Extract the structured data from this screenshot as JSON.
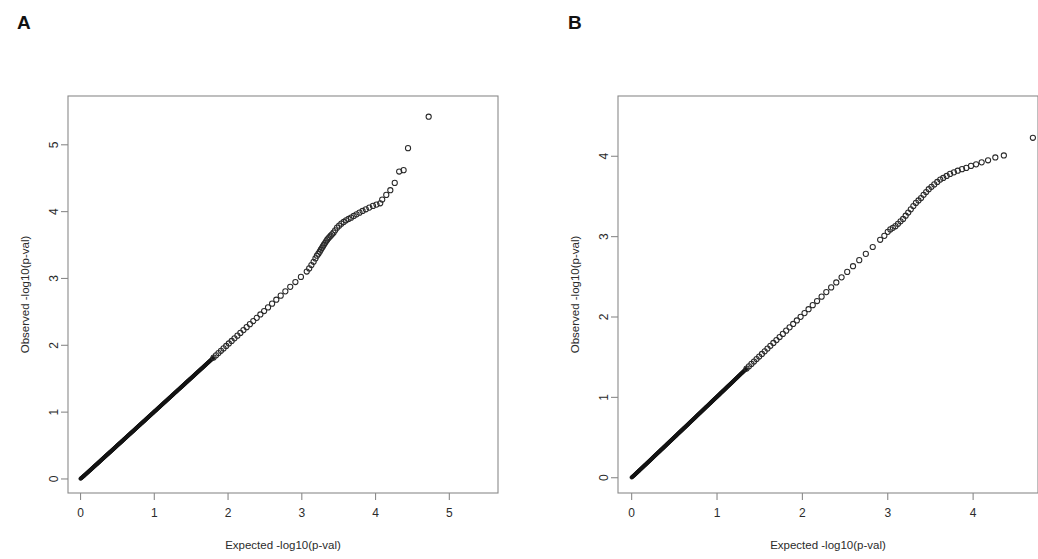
{
  "figure": {
    "background_color": "#ffffff",
    "frame_color": "#8a8a8a",
    "point_color": "#2a2a2a"
  },
  "panels": [
    {
      "letter": "A"
    },
    {
      "letter": "B"
    }
  ],
  "chart_data": [
    {
      "panel": "A",
      "type": "scatter",
      "title": "",
      "xlabel": "Expected -log10(p-val)",
      "ylabel": "Observed -log10(p-val)",
      "xlim": [
        -0.17,
        5.66
      ],
      "ylim": [
        -0.21,
        5.73
      ],
      "xticks": [
        0,
        1,
        2,
        3,
        4,
        5
      ],
      "yticks": [
        0,
        1,
        2,
        3,
        4,
        5
      ],
      "xtick_labels": [
        "0",
        "1",
        "2",
        "3",
        "4",
        "5"
      ],
      "ytick_labels": [
        "0",
        "1",
        "2",
        "3",
        "4",
        "5"
      ],
      "grid": false,
      "legend": "none",
      "marker": "open-circle",
      "description": "QQ plot of observed vs expected -log10 p-values; points follow the diagonal closely then deviate upward above expected 3.2",
      "points": [
        [
          0.0,
          0.004
        ],
        [
          0.03,
          0.031
        ],
        [
          0.055,
          0.056
        ],
        [
          0.078,
          0.079
        ],
        [
          0.1,
          0.101
        ],
        [
          0.121,
          0.122
        ],
        [
          0.141,
          0.142
        ],
        [
          0.16,
          0.161
        ],
        [
          0.179,
          0.18
        ],
        [
          0.198,
          0.199
        ],
        [
          0.216,
          0.217
        ],
        [
          0.234,
          0.235
        ],
        [
          0.252,
          0.253
        ],
        [
          0.269,
          0.271
        ],
        [
          0.287,
          0.289
        ],
        [
          0.304,
          0.306
        ],
        [
          0.321,
          0.323
        ],
        [
          0.338,
          0.34
        ],
        [
          0.355,
          0.357
        ],
        [
          0.372,
          0.374
        ],
        [
          0.389,
          0.391
        ],
        [
          0.406,
          0.408
        ],
        [
          0.423,
          0.425
        ],
        [
          0.44,
          0.442
        ],
        [
          0.457,
          0.459
        ],
        [
          0.474,
          0.476
        ],
        [
          0.491,
          0.494
        ],
        [
          0.508,
          0.511
        ],
        [
          0.525,
          0.528
        ],
        [
          0.542,
          0.545
        ],
        [
          0.559,
          0.562
        ],
        [
          0.576,
          0.579
        ],
        [
          0.593,
          0.597
        ],
        [
          0.611,
          0.614
        ],
        [
          0.628,
          0.632
        ],
        [
          0.646,
          0.65
        ],
        [
          0.663,
          0.667
        ],
        [
          0.681,
          0.685
        ],
        [
          0.699,
          0.703
        ],
        [
          0.717,
          0.721
        ],
        [
          0.735,
          0.739
        ],
        [
          0.753,
          0.758
        ],
        [
          0.771,
          0.776
        ],
        [
          0.79,
          0.795
        ],
        [
          0.808,
          0.813
        ],
        [
          0.827,
          0.832
        ],
        [
          0.846,
          0.851
        ],
        [
          0.865,
          0.87
        ],
        [
          0.884,
          0.889
        ],
        [
          0.903,
          0.909
        ],
        [
          0.923,
          0.929
        ],
        [
          0.942,
          0.948
        ],
        [
          0.962,
          0.968
        ],
        [
          0.982,
          0.988
        ],
        [
          1.002,
          1.009
        ],
        [
          1.023,
          1.029
        ],
        [
          1.043,
          1.05
        ],
        [
          1.064,
          1.071
        ],
        [
          1.085,
          1.092
        ],
        [
          1.106,
          1.113
        ],
        [
          1.128,
          1.135
        ],
        [
          1.149,
          1.157
        ],
        [
          1.171,
          1.179
        ],
        [
          1.194,
          1.202
        ],
        [
          1.216,
          1.224
        ],
        [
          1.239,
          1.247
        ],
        [
          1.262,
          1.27
        ],
        [
          1.285,
          1.294
        ],
        [
          1.309,
          1.318
        ],
        [
          1.333,
          1.342
        ],
        [
          1.357,
          1.366
        ],
        [
          1.382,
          1.391
        ],
        [
          1.407,
          1.416
        ],
        [
          1.432,
          1.442
        ],
        [
          1.458,
          1.468
        ],
        [
          1.484,
          1.494
        ],
        [
          1.511,
          1.521
        ],
        [
          1.538,
          1.548
        ],
        [
          1.565,
          1.576
        ],
        [
          1.593,
          1.604
        ],
        [
          1.622,
          1.633
        ],
        [
          1.651,
          1.662
        ],
        [
          1.68,
          1.692
        ],
        [
          1.71,
          1.722
        ],
        [
          1.741,
          1.753
        ],
        [
          1.772,
          1.784
        ],
        [
          1.804,
          1.817
        ],
        [
          1.837,
          1.85
        ],
        [
          1.87,
          1.884
        ],
        [
          1.904,
          1.918
        ],
        [
          1.939,
          1.953
        ],
        [
          1.975,
          1.99
        ],
        [
          2.011,
          2.027
        ],
        [
          2.049,
          2.065
        ],
        [
          2.087,
          2.104
        ],
        [
          2.127,
          2.144
        ],
        [
          2.167,
          2.185
        ],
        [
          2.209,
          2.227
        ],
        [
          2.252,
          2.271
        ],
        [
          2.296,
          2.316
        ],
        [
          2.342,
          2.363
        ],
        [
          2.389,
          2.411
        ],
        [
          2.438,
          2.461
        ],
        [
          2.489,
          2.513
        ],
        [
          2.542,
          2.567
        ],
        [
          2.597,
          2.623
        ],
        [
          2.654,
          2.682
        ],
        [
          2.714,
          2.743
        ],
        [
          2.777,
          2.807
        ],
        [
          2.843,
          2.875
        ],
        [
          2.913,
          2.947
        ],
        [
          2.988,
          3.023
        ],
        [
          3.067,
          3.104
        ],
        [
          3.1,
          3.15
        ],
        [
          3.13,
          3.2
        ],
        [
          3.16,
          3.25
        ],
        [
          3.185,
          3.3
        ],
        [
          3.205,
          3.34
        ],
        [
          3.225,
          3.37
        ],
        [
          3.243,
          3.4
        ],
        [
          3.258,
          3.43
        ],
        [
          3.272,
          3.455
        ],
        [
          3.286,
          3.48
        ],
        [
          3.3,
          3.505
        ],
        [
          3.315,
          3.53
        ],
        [
          3.33,
          3.555
        ],
        [
          3.345,
          3.58
        ],
        [
          3.36,
          3.6
        ],
        [
          3.375,
          3.62
        ],
        [
          3.392,
          3.64
        ],
        [
          3.41,
          3.66
        ],
        [
          3.43,
          3.685
        ],
        [
          3.452,
          3.72
        ],
        [
          3.478,
          3.76
        ],
        [
          3.506,
          3.79
        ],
        [
          3.536,
          3.82
        ],
        [
          3.568,
          3.845
        ],
        [
          3.6,
          3.87
        ],
        [
          3.634,
          3.89
        ],
        [
          3.668,
          3.91
        ],
        [
          3.704,
          3.935
        ],
        [
          3.742,
          3.96
        ],
        [
          3.782,
          3.985
        ],
        [
          3.824,
          4.01
        ],
        [
          3.868,
          4.035
        ],
        [
          3.915,
          4.06
        ],
        [
          3.965,
          4.085
        ],
        [
          4.012,
          4.105
        ],
        [
          4.063,
          4.125
        ],
        [
          4.09,
          4.18
        ],
        [
          4.145,
          4.25
        ],
        [
          4.2,
          4.32
        ],
        [
          4.26,
          4.43
        ],
        [
          4.32,
          4.6
        ],
        [
          4.38,
          4.62
        ],
        [
          4.44,
          4.95
        ],
        [
          4.72,
          5.42
        ]
      ]
    },
    {
      "panel": "B",
      "type": "scatter",
      "title": "",
      "xlabel": "Expected -log10(p-val)",
      "ylabel": "Observed -log10(p-val)",
      "xlim": [
        -0.16,
        4.76
      ],
      "ylim": [
        -0.19,
        4.75
      ],
      "xticks": [
        0,
        1,
        2,
        3,
        4
      ],
      "yticks": [
        0,
        1,
        2,
        3,
        4
      ],
      "xtick_labels": [
        "0",
        "1",
        "2",
        "3",
        "4"
      ],
      "ytick_labels": [
        "0",
        "1",
        "2",
        "3",
        "4"
      ],
      "grid": false,
      "legend": "none",
      "marker": "open-circle",
      "description": "QQ plot of observed vs expected -log10 p-values; points follow the diagonal then deviate upward above expected 3.0; right edge of panel is cropped",
      "points": [
        [
          0.0,
          0.004
        ],
        [
          0.028,
          0.029
        ],
        [
          0.052,
          0.053
        ],
        [
          0.073,
          0.074
        ],
        [
          0.094,
          0.095
        ],
        [
          0.113,
          0.114
        ],
        [
          0.132,
          0.133
        ],
        [
          0.15,
          0.151
        ],
        [
          0.168,
          0.169
        ],
        [
          0.186,
          0.187
        ],
        [
          0.203,
          0.204
        ],
        [
          0.22,
          0.221
        ],
        [
          0.237,
          0.238
        ],
        [
          0.253,
          0.255
        ],
        [
          0.27,
          0.272
        ],
        [
          0.286,
          0.288
        ],
        [
          0.302,
          0.304
        ],
        [
          0.318,
          0.32
        ],
        [
          0.334,
          0.336
        ],
        [
          0.35,
          0.352
        ],
        [
          0.366,
          0.368
        ],
        [
          0.382,
          0.384
        ],
        [
          0.398,
          0.4
        ],
        [
          0.414,
          0.417
        ],
        [
          0.43,
          0.433
        ],
        [
          0.446,
          0.449
        ],
        [
          0.462,
          0.465
        ],
        [
          0.478,
          0.481
        ],
        [
          0.494,
          0.497
        ],
        [
          0.51,
          0.513
        ],
        [
          0.526,
          0.529
        ],
        [
          0.542,
          0.546
        ],
        [
          0.558,
          0.562
        ],
        [
          0.575,
          0.579
        ],
        [
          0.591,
          0.595
        ],
        [
          0.608,
          0.612
        ],
        [
          0.625,
          0.629
        ],
        [
          0.642,
          0.646
        ],
        [
          0.659,
          0.663
        ],
        [
          0.676,
          0.681
        ],
        [
          0.693,
          0.698
        ],
        [
          0.711,
          0.716
        ],
        [
          0.729,
          0.734
        ],
        [
          0.747,
          0.752
        ],
        [
          0.765,
          0.771
        ],
        [
          0.783,
          0.789
        ],
        [
          0.802,
          0.808
        ],
        [
          0.821,
          0.827
        ],
        [
          0.84,
          0.847
        ],
        [
          0.859,
          0.866
        ],
        [
          0.879,
          0.886
        ],
        [
          0.899,
          0.906
        ],
        [
          0.919,
          0.926
        ],
        [
          0.939,
          0.947
        ],
        [
          0.96,
          0.968
        ],
        [
          0.981,
          0.989
        ],
        [
          1.003,
          1.011
        ],
        [
          1.025,
          1.033
        ],
        [
          1.047,
          1.056
        ],
        [
          1.069,
          1.078
        ],
        [
          1.092,
          1.101
        ],
        [
          1.115,
          1.125
        ],
        [
          1.139,
          1.149
        ],
        [
          1.163,
          1.173
        ],
        [
          1.188,
          1.198
        ],
        [
          1.213,
          1.224
        ],
        [
          1.238,
          1.249
        ],
        [
          1.264,
          1.276
        ],
        [
          1.291,
          1.303
        ],
        [
          1.318,
          1.33
        ],
        [
          1.346,
          1.358
        ],
        [
          1.374,
          1.387
        ],
        [
          1.403,
          1.416
        ],
        [
          1.433,
          1.446
        ],
        [
          1.463,
          1.477
        ],
        [
          1.494,
          1.508
        ],
        [
          1.526,
          1.54
        ],
        [
          1.558,
          1.573
        ],
        [
          1.591,
          1.607
        ],
        [
          1.625,
          1.641
        ],
        [
          1.66,
          1.677
        ],
        [
          1.696,
          1.713
        ],
        [
          1.733,
          1.751
        ],
        [
          1.771,
          1.79
        ],
        [
          1.81,
          1.83
        ],
        [
          1.85,
          1.871
        ],
        [
          1.892,
          1.913
        ],
        [
          1.935,
          1.957
        ],
        [
          1.979,
          2.002
        ],
        [
          2.025,
          2.049
        ],
        [
          2.072,
          2.097
        ],
        [
          2.121,
          2.147
        ],
        [
          2.172,
          2.199
        ],
        [
          2.225,
          2.253
        ],
        [
          2.28,
          2.31
        ],
        [
          2.337,
          2.368
        ],
        [
          2.397,
          2.43
        ],
        [
          2.459,
          2.494
        ],
        [
          2.525,
          2.561
        ],
        [
          2.593,
          2.632
        ],
        [
          2.666,
          2.707
        ],
        [
          2.743,
          2.786
        ],
        [
          2.824,
          2.871
        ],
        [
          2.911,
          2.961
        ],
        [
          2.96,
          3.01
        ],
        [
          3.0,
          3.06
        ],
        [
          3.03,
          3.09
        ],
        [
          3.06,
          3.11
        ],
        [
          3.09,
          3.13
        ],
        [
          3.12,
          3.16
        ],
        [
          3.15,
          3.19
        ],
        [
          3.18,
          3.22
        ],
        [
          3.21,
          3.26
        ],
        [
          3.24,
          3.3
        ],
        [
          3.27,
          3.34
        ],
        [
          3.3,
          3.38
        ],
        [
          3.33,
          3.42
        ],
        [
          3.36,
          3.45
        ],
        [
          3.39,
          3.48
        ],
        [
          3.42,
          3.52
        ],
        [
          3.45,
          3.555
        ],
        [
          3.48,
          3.59
        ],
        [
          3.512,
          3.62
        ],
        [
          3.545,
          3.65
        ],
        [
          3.58,
          3.68
        ],
        [
          3.615,
          3.71
        ],
        [
          3.65,
          3.73
        ],
        [
          3.69,
          3.755
        ],
        [
          3.73,
          3.78
        ],
        [
          3.775,
          3.8
        ],
        [
          3.82,
          3.82
        ],
        [
          3.87,
          3.84
        ],
        [
          3.92,
          3.855
        ],
        [
          3.975,
          3.88
        ],
        [
          4.035,
          3.9
        ],
        [
          4.1,
          3.925
        ],
        [
          4.175,
          3.95
        ],
        [
          4.26,
          3.985
        ],
        [
          4.36,
          4.01
        ],
        [
          4.7,
          4.23
        ]
      ]
    }
  ]
}
